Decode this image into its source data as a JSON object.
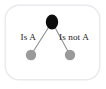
{
  "figure": {
    "kind": "taxonomy-branch-diagram",
    "frame": {
      "border_color": "#e9e9ed",
      "background_color": "#ffffff",
      "corner_radius": 14
    },
    "nodes": [
      {
        "id": "root",
        "role": "parent-concept",
        "shape": "ellipse",
        "fill": "#0d0d0d",
        "cx": 52,
        "cy": 22,
        "rx": 6.2,
        "ry": 7.4,
        "label": ""
      },
      {
        "id": "child-left",
        "role": "is-a-child",
        "shape": "circle",
        "fill": "#9a9a9a",
        "cx": 31,
        "cy": 55,
        "rx": 5.2,
        "ry": 5.2,
        "label": ""
      },
      {
        "id": "child-right",
        "role": "is-not-a-child",
        "shape": "circle",
        "fill": "#9a9a9a",
        "cx": 70,
        "cy": 55,
        "rx": 5.2,
        "ry": 5.2,
        "label": ""
      }
    ],
    "edges": [
      {
        "id": "edge-left",
        "from": "root",
        "to": "child-left",
        "color": "#8e8e8e",
        "width": 1.1,
        "label": "Is A",
        "label_x": 36,
        "label_y": 40,
        "label_anchor": "end"
      },
      {
        "id": "edge-right",
        "from": "root",
        "to": "child-right",
        "color": "#8e8e8e",
        "width": 1.1,
        "label": "Is not A",
        "label_x": 59,
        "label_y": 40,
        "label_anchor": "start"
      }
    ]
  },
  "labels": {
    "left_edge_label": "Is A",
    "right_edge_label": "Is not A"
  },
  "colors": {
    "root_node": "#0d0d0d",
    "child_node": "#9a9a9a",
    "edge": "#8e8e8e",
    "text": "#1a1a1a",
    "frame_border": "#e9e9ed",
    "background": "#ffffff"
  }
}
